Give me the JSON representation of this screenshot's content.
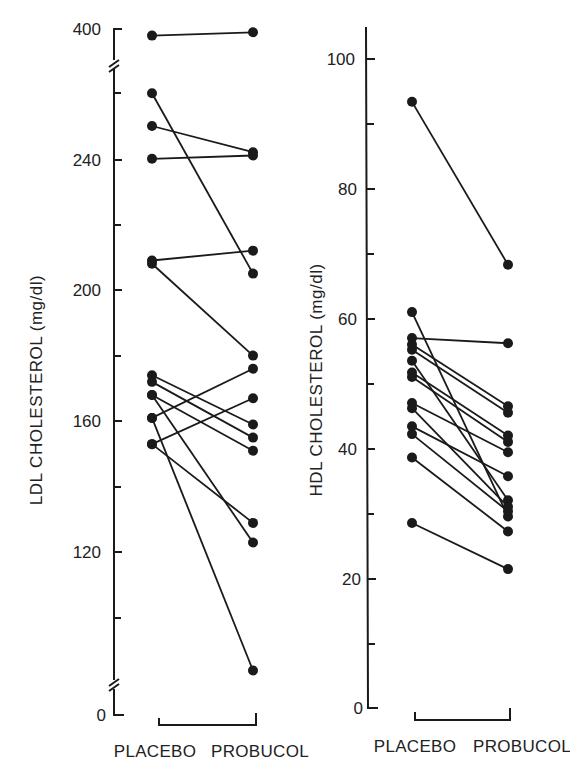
{
  "chart_data": [
    {
      "type": "line",
      "subtype": "paired-dot",
      "title": "",
      "xlabel": "",
      "ylabel": "LDL CHOLESTEROL (mg/dl)",
      "categories": [
        "PLACEBO",
        "PROBUCOL"
      ],
      "ylim": [
        0,
        400
      ],
      "axis_break": true,
      "yticks_labeled": [
        0,
        120,
        160,
        200,
        240,
        400
      ],
      "yticks_minor": [
        100,
        140,
        180,
        220,
        260
      ],
      "grid": false,
      "legend": null,
      "pairs": [
        {
          "placebo": 398,
          "probucol": 399
        },
        {
          "placebo": 260,
          "probucol": 205
        },
        {
          "placebo": 250,
          "probucol": 242
        },
        {
          "placebo": 240,
          "probucol": 241
        },
        {
          "placebo": 209,
          "probucol": 212
        },
        {
          "placebo": 208,
          "probucol": 180
        },
        {
          "placebo": 174,
          "probucol": 159
        },
        {
          "placebo": 172,
          "probucol": 155
        },
        {
          "placebo": 168,
          "probucol": 151
        },
        {
          "placebo": 168,
          "probucol": 123
        },
        {
          "placebo": 161,
          "probucol": 176
        },
        {
          "placebo": 161,
          "probucol": 84
        },
        {
          "placebo": 153,
          "probucol": 167
        },
        {
          "placebo": 153,
          "probucol": 129
        }
      ]
    },
    {
      "type": "line",
      "subtype": "paired-dot",
      "title": "",
      "xlabel": "",
      "ylabel": "HDL CHOLESTEROL (mg/dl)",
      "categories": [
        "PLACEBO",
        "PROBUCOL"
      ],
      "ylim": [
        0,
        100
      ],
      "yticks_labeled": [
        0,
        20,
        40,
        60,
        80,
        100
      ],
      "yticks_minor": [
        10,
        30,
        50,
        70,
        90
      ],
      "grid": false,
      "legend": null,
      "pairs": [
        {
          "placebo": 93.4,
          "probucol": 68.3
        },
        {
          "placebo": 61,
          "probucol": 29.5
        },
        {
          "placebo": 57,
          "probucol": 56.2
        },
        {
          "placebo": 56,
          "probucol": 46.5
        },
        {
          "placebo": 55.2,
          "probucol": 45.5
        },
        {
          "placebo": 53.5,
          "probucol": 32
        },
        {
          "placebo": 51.7,
          "probucol": 42
        },
        {
          "placebo": 51,
          "probucol": 41
        },
        {
          "placebo": 47,
          "probucol": 39.4
        },
        {
          "placebo": 46.2,
          "probucol": 31
        },
        {
          "placebo": 43.4,
          "probucol": 35.7
        },
        {
          "placebo": 42.2,
          "probucol": 30.3
        },
        {
          "placebo": 38.6,
          "probucol": 27.2
        },
        {
          "placebo": 28.5,
          "probucol": 21.4
        }
      ]
    }
  ],
  "labels": {
    "ldl_axis_title": "LDL CHOLESTEROL (mg/dl)",
    "hdl_axis_title": "HDL CHOLESTEROL (mg/dl)",
    "placebo": "PLACEBO",
    "probucol": "PROBUCOL",
    "ldl_ticks": {
      "t400": "400",
      "t240": "240",
      "t200": "200",
      "t160": "160",
      "t120": "120",
      "t0": "0"
    },
    "hdl_ticks": {
      "t100": "100",
      "t80": "80",
      "t60": "60",
      "t40": "40",
      "t20": "20",
      "t0": "0"
    }
  }
}
